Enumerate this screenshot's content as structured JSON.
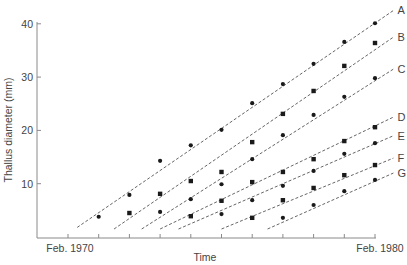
{
  "chart_data": {
    "type": "scatter",
    "title": "",
    "xlabel": "Time",
    "ylabel": "Thallus diameter (mm)",
    "x_tick_labels": [
      {
        "year": 1970,
        "label": "Feb. 1970"
      },
      {
        "year": 1980,
        "label": "Feb. 1980"
      }
    ],
    "x_ticks_years": [
      1970,
      1971,
      1972,
      1973,
      1974,
      1975,
      1976,
      1977,
      1978,
      1979,
      1980
    ],
    "xlim": [
      1969.0,
      1980.0
    ],
    "ylim": [
      0,
      40
    ],
    "y_ticks": [
      10,
      20,
      30,
      40
    ],
    "grid": false,
    "legend": "inline labels at right end of each fitted dashed line",
    "series": [
      {
        "name": "A",
        "marker": "circle",
        "x": [
          1971,
          1972,
          1973,
          1974,
          1975,
          1976,
          1977,
          1978,
          1979,
          1980
        ],
        "y": [
          3.8,
          7.9,
          14.3,
          17.2,
          20.1,
          25.1,
          28.7,
          32.5,
          36.6,
          40.1
        ],
        "fit_line": {
          "x": [
            1970.3,
            1980.6
          ],
          "y": [
            1.8,
            42.5
          ]
        }
      },
      {
        "name": "B",
        "marker": "square",
        "x": [
          1972,
          1973,
          1974,
          1975,
          1976,
          1977,
          1978,
          1979,
          1980
        ],
        "y": [
          4.5,
          8.1,
          10.5,
          12.2,
          17.8,
          23.1,
          27.4,
          32.1,
          36.4
        ],
        "fit_line": {
          "x": [
            1971.5,
            1980.6
          ],
          "y": [
            1.5,
            37.5
          ]
        }
      },
      {
        "name": "C",
        "marker": "circle",
        "x": [
          1973,
          1974,
          1975,
          1976,
          1977,
          1978,
          1979,
          1980
        ],
        "y": [
          4.7,
          7.1,
          9.9,
          14.6,
          19.1,
          22.9,
          26.3,
          29.8
        ],
        "fit_line": {
          "x": [
            1972.4,
            1980.6
          ],
          "y": [
            1.5,
            31.5
          ]
        }
      },
      {
        "name": "D",
        "marker": "square",
        "x": [
          1974,
          1975,
          1976,
          1977,
          1978,
          1979,
          1980
        ],
        "y": [
          3.9,
          6.8,
          10.3,
          12.2,
          14.6,
          18.0,
          20.6
        ],
        "fit_line": {
          "x": [
            1973.0,
            1980.6
          ],
          "y": [
            1.5,
            22.5
          ]
        }
      },
      {
        "name": "E",
        "marker": "circle",
        "x": [
          1975,
          1976,
          1977,
          1978,
          1979,
          1980
        ],
        "y": [
          4.3,
          6.9,
          9.6,
          12.4,
          15.6,
          17.6
        ],
        "fit_line": {
          "x": [
            1973.6,
            1980.6
          ],
          "y": [
            1.5,
            19.0
          ]
        }
      },
      {
        "name": "F",
        "marker": "square",
        "x": [
          1976,
          1977,
          1978,
          1979,
          1980
        ],
        "y": [
          3.6,
          6.9,
          9.2,
          11.6,
          13.5
        ],
        "fit_line": {
          "x": [
            1975.0,
            1980.6
          ],
          "y": [
            1.5,
            14.8
          ]
        }
      },
      {
        "name": "G",
        "marker": "circle",
        "x": [
          1977,
          1978,
          1979,
          1980
        ],
        "y": [
          3.6,
          6.0,
          8.6,
          10.7
        ],
        "fit_line": {
          "x": [
            1976.5,
            1980.6
          ],
          "y": [
            1.5,
            12.0
          ]
        }
      }
    ]
  },
  "colors": {
    "axis": "#8a8a8a",
    "line": "#555555",
    "marker": "#1a1a1a",
    "text": "#444444"
  }
}
